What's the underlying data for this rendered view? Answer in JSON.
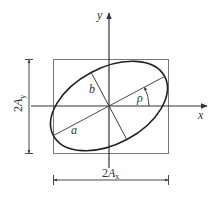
{
  "diagram": {
    "colors": {
      "background": "#ffffff",
      "ellipse": "#222222",
      "axes": "#333333",
      "box": "#777777",
      "text": "#333333"
    },
    "axes": {
      "x_label": "x",
      "y_label": "y"
    },
    "ellipse": {
      "semi_major_label": "a",
      "semi_minor_label": "b",
      "angle_label": "ρ"
    },
    "dimensions": {
      "vertical": {
        "prefix": "2",
        "symbol": "A",
        "subscript": "y"
      },
      "horizontal": {
        "prefix": "2",
        "symbol": "A",
        "subscript": "x"
      }
    }
  }
}
